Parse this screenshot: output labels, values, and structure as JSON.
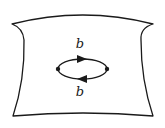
{
  "diagram": {
    "title": "",
    "colors": {
      "stroke": "#1a1a1a",
      "background": "#ffffff"
    },
    "surface": {
      "name": "surface-sheet",
      "path": "M12,24 Q83,6 153,24 Q140,28 141,40 Q141,80 153,116 Q83,110 13,116 Q25,80 24,40 Q23,28 12,24 Z"
    },
    "loop": {
      "center": [
        82.5,
        69
      ],
      "rx": 24.5,
      "ry": 10,
      "vertices": [
        {
          "name": "vertex-left",
          "x": 58,
          "y": 69
        },
        {
          "name": "vertex-right",
          "x": 107,
          "y": 69
        }
      ],
      "edges": [
        {
          "name": "edge-top",
          "label": "b",
          "direction": "right",
          "label_x": 80,
          "label_y": 48
        },
        {
          "name": "edge-bottom",
          "label": "b",
          "direction": "left",
          "label_x": 80,
          "label_y": 96
        }
      ]
    }
  }
}
